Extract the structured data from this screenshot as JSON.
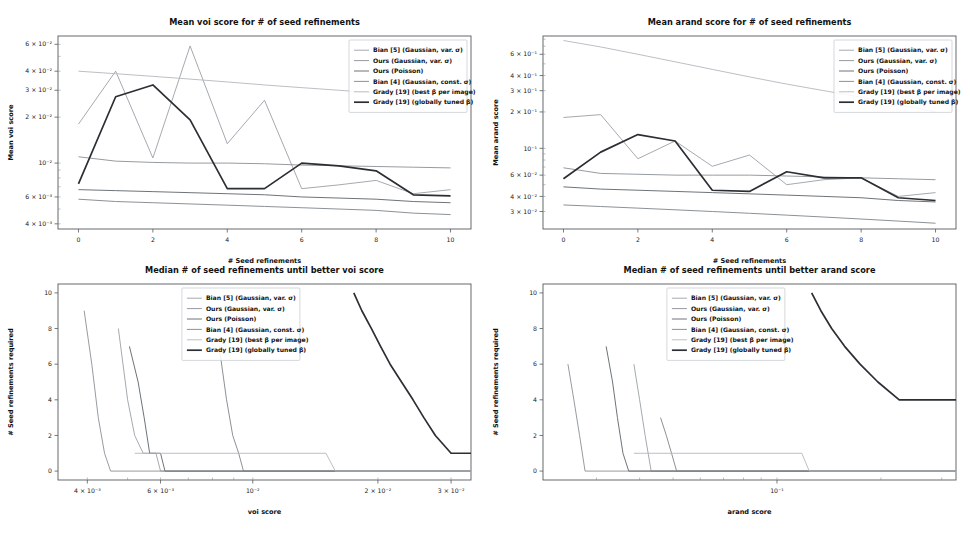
{
  "figure": {
    "background": "#ffffff",
    "panel_count": 4
  },
  "series_style": [
    {
      "name": "Bian [5] (Gaussian, var. σ)",
      "color": "#9aa0a6",
      "width": 0.9
    },
    {
      "name": "Ours (Gaussian, var. σ)",
      "color": "#8a9096",
      "width": 0.9
    },
    {
      "name": "Ours (Poisson)",
      "color": "#6d7479",
      "width": 1.0
    },
    {
      "name": "Bian [4] (Gaussian, const. σ)",
      "color": "#7e858b",
      "width": 0.9
    },
    {
      "name": "Grady [19] (best β per image)",
      "color": "#b3b8bd",
      "width": 0.9
    },
    {
      "name": "Grady [19] (globally tuned β)",
      "color": "#2b2f33",
      "width": 1.7
    }
  ],
  "legend_labels": [
    "Bian [5] (Gaussian, var. σ)",
    "Ours (Gaussian, var. σ)",
    "Ours (Poisson)",
    "Bian [4] (Gaussian, const. σ)",
    "Grady [19] (best β per image)",
    "Grady [19] (globally tuned β)"
  ],
  "chart_data": [
    {
      "id": "mean-voi",
      "type": "line",
      "title": "Mean voi score for # of seed refinements",
      "xlabel": "# Seed refinements",
      "ylabel": "Mean voi score",
      "xscale": "linear",
      "yscale": "log",
      "xlim": [
        -0.55,
        10.55
      ],
      "ylim": [
        0.0037,
        0.068
      ],
      "xticks": [
        0,
        2,
        4,
        6,
        8,
        10
      ],
      "xticklabels": [
        "0",
        "2",
        "4",
        "6",
        "8",
        "10"
      ],
      "yticks": [
        0.06,
        0.04,
        0.03,
        0.02,
        0.01,
        0.006,
        0.004
      ],
      "yticklabels": [
        "6 × 10⁻²",
        "4 × 10⁻²",
        "3 × 10⁻²",
        "2 × 10⁻²",
        "10⁻²",
        "6 × 10⁻³",
        "4 × 10⁻³"
      ],
      "grid": false,
      "legend_position": "upper right",
      "x": [
        0,
        1,
        2,
        3,
        4,
        5,
        6,
        7,
        8,
        9,
        10
      ],
      "series": [
        {
          "name": "Bian [5] (Gaussian, var. σ)",
          "values": [
            0.018,
            0.04,
            0.0108,
            0.0585,
            0.0134,
            0.0258,
            0.0068,
            0.0072,
            0.0077,
            0.0063,
            0.0067
          ]
        },
        {
          "name": "Ours (Gaussian, var. σ)",
          "values": [
            0.011,
            0.0103,
            0.0101,
            0.01,
            0.01,
            0.0099,
            0.0097,
            0.0096,
            0.0095,
            0.0094,
            0.0093
          ]
        },
        {
          "name": "Ours (Poisson)",
          "values": [
            0.0067,
            0.0066,
            0.0065,
            0.0064,
            0.0063,
            0.0062,
            0.006,
            0.0059,
            0.0058,
            0.0056,
            0.0055
          ]
        },
        {
          "name": "Bian [4] (Gaussian, const. σ)",
          "values": [
            0.0058,
            0.0056,
            0.0055,
            0.0054,
            0.0053,
            0.0052,
            0.0051,
            0.005,
            0.0049,
            0.0047,
            0.0046
          ]
        },
        {
          "name": "Grady [19] (best β per image)",
          "values": [
            0.04,
            0.0385,
            0.037,
            0.0355,
            0.034,
            0.0325,
            0.0312,
            0.03,
            0.0288,
            0.0275,
            0.0262
          ]
        },
        {
          "name": "Grady [19] (globally tuned β)",
          "values": [
            0.0073,
            0.0272,
            0.0325,
            0.0192,
            0.0068,
            0.0068,
            0.01,
            0.0096,
            0.0089,
            0.0062,
            0.0061
          ]
        }
      ]
    },
    {
      "id": "mean-arand",
      "type": "line",
      "title": "Mean arand score for # of seed refinements",
      "xlabel": "# Seed refinements",
      "ylabel": "Mean arand score",
      "xscale": "linear",
      "yscale": "log",
      "xlim": [
        -0.55,
        10.55
      ],
      "ylim": [
        0.0215,
        0.85
      ],
      "xticks": [
        0,
        2,
        4,
        6,
        8,
        10
      ],
      "xticklabels": [
        "0",
        "2",
        "4",
        "6",
        "8",
        "10"
      ],
      "yticks": [
        0.6,
        0.4,
        0.3,
        0.2,
        0.1,
        0.06,
        0.04,
        0.03
      ],
      "yticklabels": [
        "6 × 10⁻¹",
        "4 × 10⁻¹",
        "3 × 10⁻¹",
        "2 × 10⁻¹",
        "10⁻¹",
        "6 × 10⁻²",
        "4 × 10⁻²",
        "3 × 10⁻²"
      ],
      "grid": false,
      "legend_position": "upper right",
      "x": [
        0,
        1,
        2,
        3,
        4,
        5,
        6,
        7,
        8,
        9,
        10
      ],
      "series": [
        {
          "name": "Bian [5] (Gaussian, var. σ)",
          "values": [
            0.18,
            0.19,
            0.082,
            0.115,
            0.071,
            0.088,
            0.05,
            0.055,
            0.057,
            0.04,
            0.043
          ]
        },
        {
          "name": "Ours (Gaussian, var. σ)",
          "values": [
            0.069,
            0.062,
            0.061,
            0.06,
            0.06,
            0.06,
            0.059,
            0.058,
            0.057,
            0.056,
            0.055
          ]
        },
        {
          "name": "Ours (Poisson)",
          "values": [
            0.048,
            0.046,
            0.045,
            0.044,
            0.043,
            0.042,
            0.041,
            0.04,
            0.039,
            0.037,
            0.036
          ]
        },
        {
          "name": "Bian [4] (Gaussian, const. σ)",
          "values": [
            0.034,
            0.033,
            0.032,
            0.031,
            0.03,
            0.029,
            0.028,
            0.027,
            0.026,
            0.025,
            0.024
          ]
        },
        {
          "name": "Grady [19] (best β per image)",
          "values": [
            0.78,
            0.69,
            0.6,
            0.52,
            0.45,
            0.39,
            0.34,
            0.3,
            0.265,
            0.23,
            0.2
          ]
        },
        {
          "name": "Grady [19] (globally tuned β)",
          "values": [
            0.056,
            0.093,
            0.13,
            0.115,
            0.045,
            0.044,
            0.064,
            0.057,
            0.057,
            0.039,
            0.037
          ]
        }
      ]
    },
    {
      "id": "median-voi",
      "type": "line",
      "title": "Median # of seed refinements until better voi score",
      "xlabel": "voi score",
      "ylabel": "# Seed refinements required",
      "xscale": "log",
      "yscale": "linear",
      "xlim": [
        0.0034,
        0.0335
      ],
      "ylim": [
        -0.5,
        10.5
      ],
      "xticks": [
        0.004,
        0.006,
        0.01,
        0.02,
        0.03
      ],
      "xticklabels": [
        "4 × 10⁻³",
        "6 × 10⁻³",
        "10⁻²",
        "2 × 10⁻²",
        "3 × 10⁻²"
      ],
      "yticks": [
        0,
        2,
        4,
        6,
        8,
        10
      ],
      "yticklabels": [
        "0",
        "2",
        "4",
        "6",
        "8",
        "10"
      ],
      "grid": false,
      "legend_position": "upper center",
      "series": [
        {
          "name": "Bian [5] (Gaussian, var. σ)",
          "points": [
            [
              0.00475,
              8
            ],
            [
              0.005,
              4
            ],
            [
              0.0052,
              2
            ],
            [
              0.00545,
              1
            ],
            [
              0.00585,
              1
            ],
            [
              0.006,
              0
            ],
            [
              0.0335,
              0
            ]
          ]
        },
        {
          "name": "Ours (Gaussian, var. σ)",
          "points": [
            [
              0.00393,
              9
            ],
            [
              0.0041,
              6
            ],
            [
              0.00425,
              3
            ],
            [
              0.0044,
              1
            ],
            [
              0.00455,
              0
            ],
            [
              0.0335,
              0
            ]
          ]
        },
        {
          "name": "Ours (Poisson)",
          "points": [
            [
              0.00505,
              7
            ],
            [
              0.0053,
              5
            ],
            [
              0.00548,
              3
            ],
            [
              0.00565,
              1
            ],
            [
              0.006,
              1
            ],
            [
              0.00615,
              0
            ],
            [
              0.0335,
              0
            ]
          ]
        },
        {
          "name": "Bian [4] (Gaussian, const. σ)",
          "points": [
            [
              0.0083,
              7
            ],
            [
              0.00865,
              4
            ],
            [
              0.00895,
              2
            ],
            [
              0.00925,
              1
            ],
            [
              0.0095,
              0
            ],
            [
              0.0335,
              0
            ]
          ]
        },
        {
          "name": "Grady [19] (best β per image)",
          "points": [
            [
              0.0052,
              1
            ],
            [
              0.015,
              1
            ],
            [
              0.0158,
              0
            ],
            [
              0.0335,
              0
            ]
          ]
        },
        {
          "name": "Grady [19] (globally tuned β)",
          "points": [
            [
              0.0175,
              10
            ],
            [
              0.0183,
              9
            ],
            [
              0.0193,
              8
            ],
            [
              0.0203,
              7
            ],
            [
              0.0214,
              6
            ],
            [
              0.0228,
              5
            ],
            [
              0.0243,
              4
            ],
            [
              0.0258,
              3
            ],
            [
              0.0275,
              2
            ],
            [
              0.03,
              1
            ],
            [
              0.0335,
              1
            ]
          ]
        }
      ]
    },
    {
      "id": "median-arand",
      "type": "line",
      "title": "Median # of seed refinements until better arand score",
      "xlabel": "arand score",
      "ylabel": "# Seed refinements required",
      "xscale": "log",
      "yscale": "linear",
      "xlim": [
        0.021,
        0.33
      ],
      "ylim": [
        -0.5,
        10.5
      ],
      "xticks": [
        0.1
      ],
      "xticklabels": [
        "10⁻¹"
      ],
      "yticks": [
        0,
        2,
        4,
        6,
        8,
        10
      ],
      "yticklabels": [
        "0",
        "2",
        "4",
        "6",
        "8",
        "10"
      ],
      "grid": false,
      "legend_position": "upper center",
      "series": [
        {
          "name": "Bian [5] (Gaussian, var. σ)",
          "points": [
            [
              0.0385,
              6
            ],
            [
              0.04,
              4
            ],
            [
              0.0415,
              2
            ],
            [
              0.0432,
              0
            ],
            [
              0.33,
              0
            ]
          ]
        },
        {
          "name": "Ours (Gaussian, var. σ)",
          "points": [
            [
              0.0248,
              6
            ],
            [
              0.0258,
              4
            ],
            [
              0.0268,
              2
            ],
            [
              0.0278,
              0
            ],
            [
              0.33,
              0
            ]
          ]
        },
        {
          "name": "Ours (Poisson)",
          "points": [
            [
              0.032,
              7
            ],
            [
              0.0334,
              5
            ],
            [
              0.0345,
              3
            ],
            [
              0.0358,
              1
            ],
            [
              0.0372,
              0
            ],
            [
              0.33,
              0
            ]
          ]
        },
        {
          "name": "Bian [4] (Gaussian, const. σ)",
          "points": [
            [
              0.046,
              3
            ],
            [
              0.0478,
              2
            ],
            [
              0.0495,
              1
            ],
            [
              0.0512,
              0
            ],
            [
              0.33,
              0
            ]
          ]
        },
        {
          "name": "Grady [19] (best β per image)",
          "points": [
            [
              0.0385,
              1
            ],
            [
              0.118,
              1
            ],
            [
              0.124,
              0
            ],
            [
              0.33,
              0
            ]
          ]
        },
        {
          "name": "Grady [19] (globally tuned β)",
          "points": [
            [
              0.126,
              10
            ],
            [
              0.134,
              9
            ],
            [
              0.144,
              8
            ],
            [
              0.157,
              7
            ],
            [
              0.174,
              6
            ],
            [
              0.196,
              5
            ],
            [
              0.226,
              4
            ],
            [
              0.33,
              4
            ]
          ]
        }
      ]
    }
  ]
}
